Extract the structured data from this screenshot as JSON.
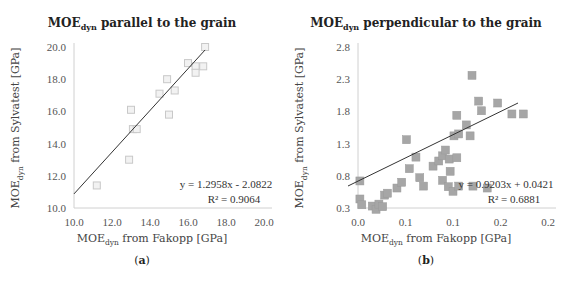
{
  "chart_data": [
    {
      "id": "a",
      "type": "scatter",
      "title": "MOEdyn parallel to the grain",
      "title_main": "MOE",
      "title_sub": "dyn",
      "title_rest": " parallel to the grain",
      "xlabel": "MOEdyn from Fakopp [GPa]",
      "ylabel": "MOEdyn from Sylvatest [GPa]",
      "xlim": [
        10.0,
        20.0
      ],
      "ylim": [
        10.0,
        20.0
      ],
      "x_ticks": [
        "10.0",
        "12.0",
        "14.0",
        "16.0",
        "18.0",
        "20.0"
      ],
      "y_ticks": [
        "10.0",
        "12.0",
        "14.0",
        "16.0",
        "18.0",
        "20.0"
      ],
      "grid": false,
      "marker": "hollow-square",
      "marker_color": "#d9d9d9",
      "series": [
        {
          "name": "parallel",
          "points": [
            [
              11.2,
              11.4
            ],
            [
              12.9,
              13.0
            ],
            [
              13.1,
              14.9
            ],
            [
              13.3,
              14.9
            ],
            [
              13.0,
              16.1
            ],
            [
              14.5,
              17.1
            ],
            [
              15.3,
              17.3
            ],
            [
              14.9,
              18.0
            ],
            [
              15.0,
              15.8
            ],
            [
              16.0,
              19.0
            ],
            [
              16.4,
              18.8
            ],
            [
              16.8,
              18.8
            ],
            [
              16.4,
              18.4
            ],
            [
              16.9,
              20.0
            ]
          ]
        }
      ],
      "trendline": {
        "type": "linear",
        "slope": 1.2958,
        "intercept": -2.0822,
        "x_range": [
          10.0,
          16.9
        ]
      },
      "equation": "y = 1.2958x - 2.0822",
      "r_squared": "R² = 0.9064",
      "caption": "(a)"
    },
    {
      "id": "b",
      "type": "scatter",
      "title": "MOEdyn perpendicular to the grain",
      "title_main": "MOE",
      "title_sub": "dyn",
      "title_rest": " perpendicular to the grain",
      "xlabel": "MOEdyn from Fakopp [GPa]",
      "ylabel": "MOEdyn from Sylvatest [GPa]",
      "xlim": [
        0.0,
        0.2
      ],
      "ylim": [
        0.3,
        2.8
      ],
      "x_ticks": [
        "0.0",
        "0.1",
        "0.1",
        "0.2",
        "0.2"
      ],
      "y_ticks": [
        "0.3",
        "0.8",
        "1.3",
        "1.8",
        "2.3",
        "2.8"
      ],
      "grid": false,
      "marker": "filled-square",
      "marker_color": "#a6a6a6",
      "series": [
        {
          "name": "perpendicular",
          "points": [
            [
              0.002,
              0.72
            ],
            [
              0.002,
              0.44
            ],
            [
              0.004,
              0.35
            ],
            [
              0.015,
              0.33
            ],
            [
              0.019,
              0.28
            ],
            [
              0.022,
              0.36
            ],
            [
              0.026,
              0.32
            ],
            [
              0.028,
              0.5
            ],
            [
              0.031,
              0.53
            ],
            [
              0.041,
              0.61
            ],
            [
              0.046,
              0.7
            ],
            [
              0.051,
              1.36
            ],
            [
              0.054,
              0.91
            ],
            [
              0.061,
              1.09
            ],
            [
              0.065,
              0.77
            ],
            [
              0.069,
              0.64
            ],
            [
              0.079,
              0.95
            ],
            [
              0.085,
              1.03
            ],
            [
              0.089,
              1.11
            ],
            [
              0.089,
              0.73
            ],
            [
              0.092,
              1.2
            ],
            [
              0.095,
              0.63
            ],
            [
              0.096,
              1.06
            ],
            [
              0.097,
              0.87
            ],
            [
              0.1,
              0.56
            ],
            [
              0.101,
              1.42
            ],
            [
              0.104,
              1.08
            ],
            [
              0.104,
              1.74
            ],
            [
              0.106,
              1.45
            ],
            [
              0.106,
              0.64
            ],
            [
              0.114,
              1.59
            ],
            [
              0.118,
              1.42
            ],
            [
              0.12,
              2.36
            ],
            [
              0.121,
              0.64
            ],
            [
              0.127,
              1.96
            ],
            [
              0.13,
              1.81
            ],
            [
              0.136,
              0.61
            ],
            [
              0.147,
              1.93
            ],
            [
              0.162,
              1.76
            ],
            [
              0.174,
              1.76
            ]
          ]
        }
      ],
      "trendline": {
        "type": "linear",
        "slope": 0.9203,
        "intercept": 0.0421,
        "px_start": [
          348,
          186
        ],
        "px_end": [
          518,
          103
        ]
      },
      "equation": "y = 0.9203x + 0.0421",
      "r_squared": "R² = 0.6881",
      "caption": "(b)"
    }
  ],
  "panels": {
    "a": {
      "title_main": "MOE",
      "title_sub": "dyn",
      "title_rest": " parallel to the grain",
      "ylabel_main": "MOE",
      "ylabel_sub": "dyn",
      "ylabel_rest": " from Sylvatest [GPa]",
      "xlabel_main": "MOE",
      "xlabel_sub": "dyn",
      "xlabel_rest": " from Fakopp  [GPa]",
      "caption_open": "(",
      "caption_letter": "a",
      "caption_close": ")"
    },
    "b": {
      "title_main": "MOE",
      "title_sub": "dyn",
      "title_rest": " perpendicular to the grain",
      "ylabel_main": "MOE",
      "ylabel_sub": "dyn",
      "ylabel_rest": " from Sylvatest [GPa]",
      "xlabel_main": "MOE",
      "xlabel_sub": "dyn",
      "xlabel_rest": " from Fakopp  [GPa]",
      "caption_open": "(",
      "caption_letter": "b",
      "caption_close": ")"
    }
  }
}
